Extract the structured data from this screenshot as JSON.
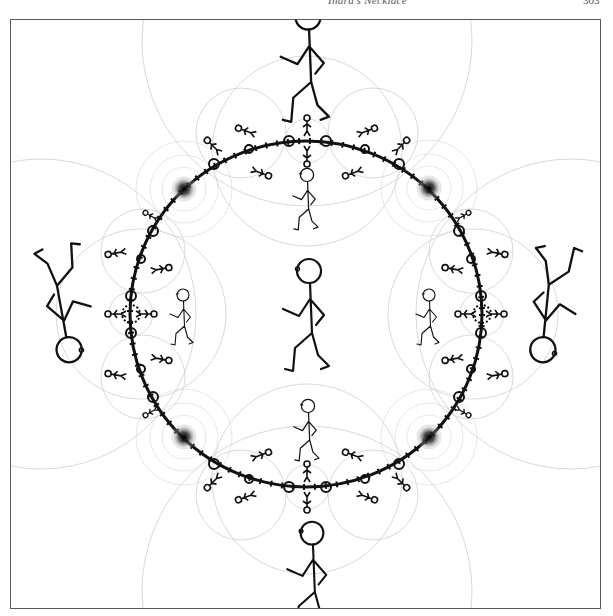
{
  "page": {
    "running_head": "Indra's Necklace",
    "page_number": "303"
  },
  "figure": {
    "colors": {
      "ink": "#111111",
      "circle_lines": "#c8c8c8",
      "frame": "#5a5a5a",
      "background": "#ffffff"
    },
    "necklace": {
      "cx": 305,
      "cy": 313,
      "rx": 176,
      "ry": 173
    },
    "cusp_points": [
      {
        "x": 183,
        "y": 188
      },
      {
        "x": 428,
        "y": 187
      },
      {
        "x": 183,
        "y": 436
      },
      {
        "x": 428,
        "y": 436
      }
    ],
    "figures": [
      {
        "id": "center",
        "x": 308,
        "y": 312,
        "scale": 1.0,
        "rotate": 0
      },
      {
        "id": "top-outer",
        "x": 307,
        "y": 50,
        "scale": 1.05,
        "rotate": 0
      },
      {
        "id": "bottom-outer",
        "x": 311,
        "y": 570,
        "scale": 0.95,
        "rotate": 0
      },
      {
        "id": "left-outer",
        "x": 60,
        "y": 310,
        "scale": 1.05,
        "rotate": 180
      },
      {
        "id": "right-outer",
        "x": 550,
        "y": 310,
        "scale": 1.05,
        "rotate": 180
      },
      {
        "id": "top-inner",
        "x": 306,
        "y": 200,
        "scale": 0.55,
        "rotate": 0
      },
      {
        "id": "bottom-inner",
        "x": 307,
        "y": 430,
        "scale": 0.55,
        "rotate": 0
      },
      {
        "id": "left-inner",
        "x": 180,
        "y": 315,
        "scale": 0.5,
        "rotate": 0
      },
      {
        "id": "right-inner",
        "x": 430,
        "y": 315,
        "scale": 0.5,
        "rotate": 0
      }
    ]
  }
}
